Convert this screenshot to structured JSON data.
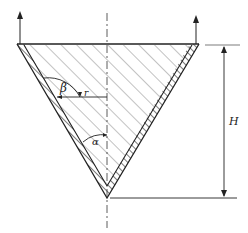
{
  "diagram": {
    "labels": {
      "beta": "β",
      "r": "r",
      "alpha": "α",
      "H": "H"
    },
    "colors": {
      "stroke": "#222222",
      "hatch": "#555555",
      "background": "#ffffff"
    },
    "elements": [
      "inverted cone (triangle) with hatched fill",
      "double-line hatched wall",
      "vertical center axis (dash-dot)",
      "two upward lift arrows at top corners",
      "radius r with angle beta arc",
      "half-angle alpha arc at apex",
      "height dimension H on the right"
    ]
  }
}
